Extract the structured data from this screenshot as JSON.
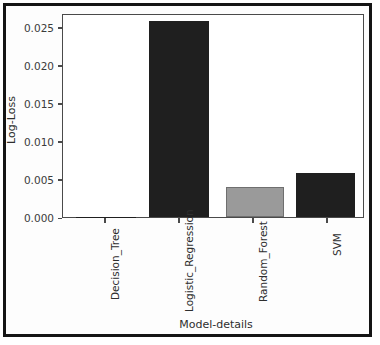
{
  "chart_data": {
    "type": "bar",
    "title": "",
    "xlabel": "Model-details",
    "ylabel": "Log-Loss",
    "categories": [
      "Decision_Tree",
      "Logistic_Regression",
      "Random_Forest",
      "SVM"
    ],
    "values": [
      0.0,
      0.0257,
      0.004,
      0.0058
    ],
    "bar_colors": [
      "#1f1f1f",
      "#1f1f1f",
      "#9a9a9a",
      "#1f1f1f"
    ],
    "ylim": [
      0.0,
      0.0268
    ],
    "yticks": [
      0.0,
      0.005,
      0.01,
      0.015,
      0.02,
      0.025
    ],
    "ytick_labels": [
      "0.000",
      "0.005",
      "0.010",
      "0.015",
      "0.020",
      "0.025"
    ],
    "grid": false,
    "legend": null,
    "xtick_rotation": 90
  },
  "figure": {
    "frame_color": "#141414",
    "axis_color": "#4a4a4a",
    "background": "#ffffff"
  }
}
